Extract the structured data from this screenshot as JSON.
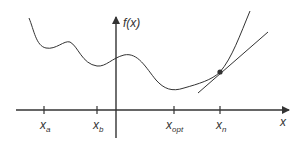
{
  "diagram": {
    "y_axis_label": "f(x)",
    "x_axis_label": "x",
    "ticks": [
      {
        "base": "x",
        "sub": "a"
      },
      {
        "base": "x",
        "sub": "b"
      },
      {
        "base": "x",
        "sub": "opt"
      },
      {
        "base": "x",
        "sub": "n"
      }
    ],
    "colors": {
      "line": "#333333",
      "background": "#ffffff"
    }
  }
}
